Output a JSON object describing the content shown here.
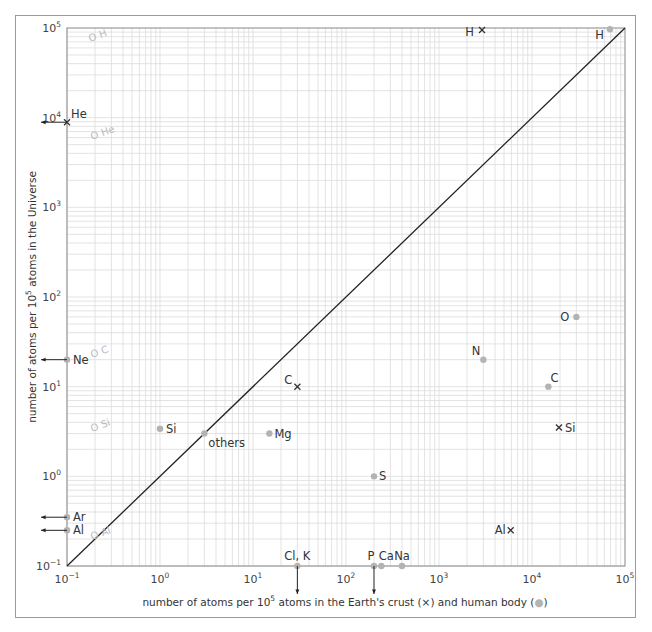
{
  "chart_data": {
    "type": "scatter",
    "title": "",
    "xlabel": "number of atoms per 10^5 atoms in the Earth's crust (×) and human body (●)",
    "ylabel": "number of atoms per 10^5 atoms in the Universe",
    "xscale": "log",
    "yscale": "log",
    "xlim": [
      0.1,
      100000
    ],
    "ylim": [
      0.1,
      100000
    ],
    "grid": true,
    "x_ticks": [
      "10^-1",
      "10^0",
      "10^1",
      "10^2",
      "10^3",
      "10^4",
      "10^5"
    ],
    "y_ticks": [
      "10^-1",
      "10^0",
      "10^1",
      "10^2",
      "10^3",
      "10^4",
      "10^5"
    ],
    "reference_line": {
      "label": "y = x",
      "from": [
        0.1,
        0.1
      ],
      "to": [
        100000,
        100000
      ]
    },
    "series": [
      {
        "name": "Earth's crust",
        "marker": "x",
        "points": [
          {
            "label": "H",
            "x": 2900,
            "y": 95000
          },
          {
            "label": "He",
            "x": 0.1,
            "y": 8900,
            "off_axis": "left"
          },
          {
            "label": "C",
            "x": 30,
            "y": 10
          },
          {
            "label": "Si",
            "x": 19500,
            "y": 3.5
          },
          {
            "label": "Al",
            "x": 5900,
            "y": 0.25
          }
        ]
      },
      {
        "name": "human body",
        "marker": "dot",
        "points": [
          {
            "label": "H",
            "x": 69000,
            "y": 97000
          },
          {
            "label": "O",
            "x": 30000,
            "y": 60
          },
          {
            "label": "N",
            "x": 3000,
            "y": 20
          },
          {
            "label": "C",
            "x": 15000,
            "y": 10
          },
          {
            "label": "Si",
            "x": 1,
            "y": 3.4
          },
          {
            "label": "others",
            "x": 3,
            "y": 3
          },
          {
            "label": "Mg",
            "x": 15,
            "y": 3
          },
          {
            "label": "S",
            "x": 200,
            "y": 1
          },
          {
            "label": "Ne",
            "x": 0.1,
            "y": 20,
            "off_axis": "left"
          },
          {
            "label": "Ar",
            "x": 0.1,
            "y": 0.35,
            "off_axis": "left"
          },
          {
            "label": "Al",
            "x": 0.1,
            "y": 0.25,
            "off_axis": "left"
          },
          {
            "label": "Cl, K",
            "x": 30,
            "y": 0.1,
            "off_axis": "below"
          },
          {
            "label": "P",
            "x": 200,
            "y": 0.1,
            "off_axis": "below"
          },
          {
            "label": "Ca",
            "x": 240,
            "y": 0.1
          },
          {
            "label": "Na",
            "x": 400,
            "y": 0.1
          }
        ]
      }
    ],
    "annotations_faint": [
      "O H",
      "O He",
      "O C",
      "O Si",
      "O Al"
    ]
  },
  "labels": {
    "x_title_pre": "number of atoms per 10",
    "x_title_sup": "5",
    "x_title_post": " atoms in the Earth's crust (×) and human body (",
    "x_title_end": ")",
    "y_title_pre": "number of atoms per 10",
    "y_title_sup": "5",
    "y_title_post": " atoms in the Universe"
  },
  "colors": {
    "grid": "#dcdcdc",
    "axis": "#888888",
    "dot": "#b3b3b3",
    "cross": "#333333",
    "line": "#222222"
  }
}
